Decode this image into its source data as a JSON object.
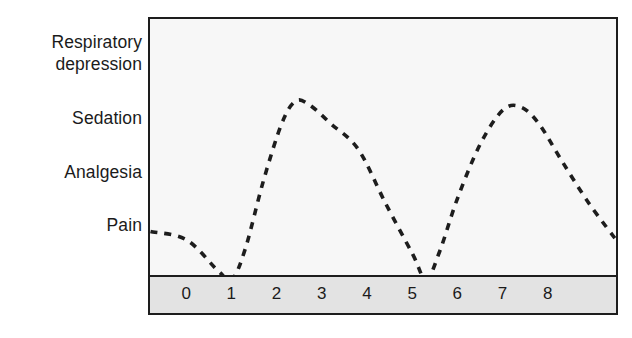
{
  "chart_data": {
    "type": "line",
    "title": "",
    "xlabel": "",
    "ylabel": "",
    "line_style": "dashed",
    "line_color": "#1d1d1d",
    "grid": false,
    "legend": null,
    "plot_background": "#f7f7f7",
    "axis_strip_background": "#e3e3e3",
    "border_color": "#1d1d1d",
    "y_categories": [
      "Respiratory\ndepression",
      "Sedation",
      "Analgesia",
      "Pain"
    ],
    "y_category_values": [
      4,
      3,
      2,
      1
    ],
    "x_ticks": [
      "0",
      "1",
      "2",
      "3",
      "4",
      "5",
      "6",
      "7",
      "8"
    ],
    "x_tick_values": [
      0,
      1,
      2,
      3,
      4,
      5,
      6,
      7,
      8
    ],
    "xlim": [
      -0.8,
      9.6
    ],
    "ylim": [
      0,
      4.6
    ],
    "annotations": [],
    "series": [
      {
        "name": "Drug effect over time",
        "style": "dashed",
        "x": [
          -0.8,
          0.0,
          0.7,
          1.0,
          1.3,
          1.7,
          2.1,
          2.4,
          2.7,
          3.2,
          3.8,
          4.4,
          5.0,
          5.3,
          5.6,
          6.0,
          6.5,
          7.0,
          7.4,
          7.8,
          8.3,
          8.9,
          9.6
        ],
        "y": [
          0.85,
          0.7,
          0.15,
          0.0,
          0.55,
          1.75,
          2.75,
          3.15,
          3.1,
          2.75,
          2.3,
          1.35,
          0.45,
          0.0,
          0.5,
          1.45,
          2.4,
          3.0,
          3.05,
          2.75,
          2.1,
          1.35,
          0.6
        ],
        "key_points": {
          "left_edge_entry": {
            "x": -0.8,
            "y": 0.85,
            "label": "near Pain"
          },
          "first_trough": {
            "x": 1.0,
            "y": 0.0
          },
          "first_peak": {
            "x": 2.45,
            "y": 3.17,
            "label": "just above Sedation"
          },
          "second_trough": {
            "x": 5.3,
            "y": 0.0
          },
          "second_peak": {
            "x": 7.2,
            "y": 3.05,
            "label": "just above Sedation"
          },
          "right_edge_exit": {
            "x": 9.6,
            "y": 0.6
          }
        }
      }
    ]
  }
}
